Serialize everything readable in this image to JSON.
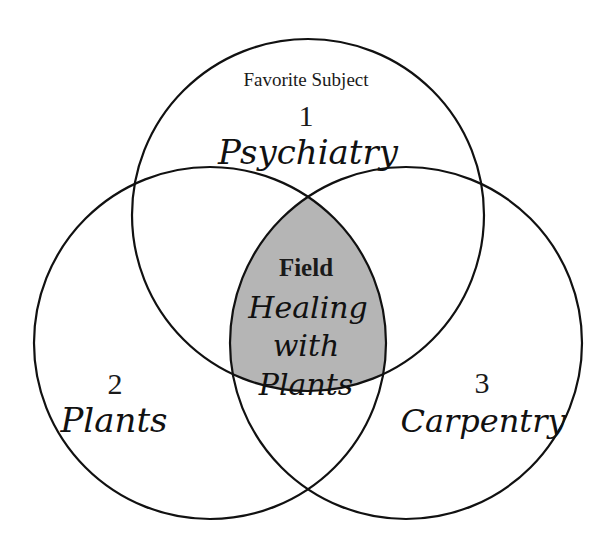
{
  "diagram": {
    "type": "venn",
    "header_label": "Favorite Subject",
    "circles": [
      {
        "number": "1",
        "label": "Psychiatry"
      },
      {
        "number": "2",
        "label": "Plants"
      },
      {
        "number": "3",
        "label": "Carpentry"
      }
    ],
    "intersection": {
      "title": "Field",
      "lines": [
        "Healing",
        "with",
        "Plants"
      ],
      "fill_color": "#b3b3b3"
    },
    "stroke_color": "#111111"
  }
}
